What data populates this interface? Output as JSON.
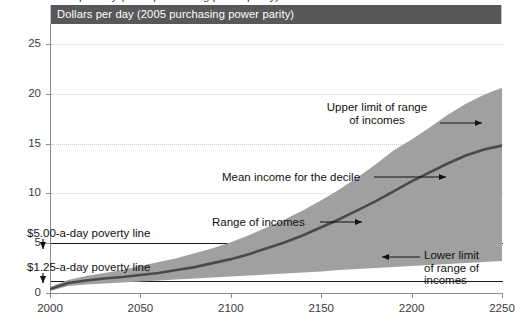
{
  "figure": {
    "clipped_top_text": "Dollars per day (2005 purchasing power parity)",
    "title": "Dollars per day (2005 purchasing power parity)"
  },
  "colors": {
    "title_bar": "#58585a",
    "band": "#a0a0a0",
    "mean_line": "#4a4a4a",
    "poverty_line": "#1a1a1a",
    "axis": "#8c8c8c",
    "grid": "#cfcfcf",
    "text": "#111111"
  },
  "annotations": [
    {
      "name": "upper-limit",
      "lines": [
        "Upper limit of range",
        "of incomes"
      ],
      "align": "center"
    },
    {
      "name": "mean-income",
      "lines": [
        "Mean income for the decile"
      ],
      "align": "left"
    },
    {
      "name": "range-of-incomes",
      "lines": [
        "Range of incomes"
      ],
      "align": "left"
    },
    {
      "name": "lower-limit",
      "lines": [
        "Lower limit",
        "of range of",
        "incomes"
      ],
      "align": "left"
    },
    {
      "name": "poverty-500",
      "lines": [
        "$5.00-a-day poverty line"
      ],
      "align": "left"
    },
    {
      "name": "poverty-125",
      "lines": [
        "$1.25-a-day poverty line"
      ],
      "align": "left"
    }
  ],
  "annotation_text": {
    "upper_limit_l1": "Upper limit of range",
    "upper_limit_l2": "of incomes",
    "mean_income": "Mean income for the decile",
    "range_of_incomes": "Range of incomes",
    "lower_limit_l1": "Lower limit",
    "lower_limit_l2": "of range of",
    "lower_limit_l3": "incomes",
    "poverty_500": "$5.00-a-day poverty line",
    "poverty_125": "$1.25-a-day poverty line"
  },
  "chart_data": {
    "type": "area",
    "title": "Dollars per day (2005 purchasing power parity)",
    "xlabel": "",
    "ylabel": "Dollars per day (2005 purchasing power parity)",
    "xlim": [
      2000,
      2250
    ],
    "ylim": [
      0,
      27
    ],
    "grid": "horizontal dotted at y ticks",
    "legend": "none (inline arrow annotations)",
    "xticks": [
      2000,
      2050,
      2100,
      2150,
      2200,
      2250
    ],
    "yticks": [
      0,
      5,
      10,
      15,
      20,
      25
    ],
    "x": [
      2000,
      2010,
      2020,
      2030,
      2040,
      2050,
      2060,
      2070,
      2080,
      2090,
      2100,
      2110,
      2120,
      2130,
      2140,
      2150,
      2160,
      2170,
      2180,
      2190,
      2200,
      2210,
      2220,
      2230,
      2240,
      2250
    ],
    "series": [
      {
        "name": "Upper limit of range of incomes",
        "values": [
          0.6,
          1.3,
          1.7,
          2.0,
          2.3,
          2.7,
          3.1,
          3.5,
          4.0,
          4.5,
          5.1,
          5.8,
          6.6,
          7.4,
          8.3,
          9.3,
          10.4,
          11.6,
          12.9,
          14.3,
          15.4,
          16.6,
          17.9,
          19.0,
          19.9,
          20.6
        ]
      },
      {
        "name": "Mean income for the decile",
        "values": [
          0.4,
          1.0,
          1.25,
          1.45,
          1.6,
          1.8,
          2.0,
          2.3,
          2.6,
          3.0,
          3.4,
          3.9,
          4.5,
          5.1,
          5.8,
          6.6,
          7.4,
          8.3,
          9.2,
          10.2,
          11.2,
          12.1,
          13.0,
          13.8,
          14.4,
          14.8
        ]
      },
      {
        "name": "Lower limit of range of incomes",
        "values": [
          0.2,
          0.7,
          0.85,
          0.95,
          1.05,
          1.15,
          1.25,
          1.35,
          1.45,
          1.55,
          1.65,
          1.75,
          1.85,
          1.95,
          2.05,
          2.15,
          2.3,
          2.4,
          2.5,
          2.6,
          2.7,
          2.8,
          2.9,
          3.0,
          3.1,
          3.2
        ]
      }
    ],
    "reference_lines": [
      {
        "name": "$5.00-a-day poverty line",
        "value": 5.0
      },
      {
        "name": "$1.25-a-day poverty line",
        "value": 1.25
      }
    ]
  }
}
